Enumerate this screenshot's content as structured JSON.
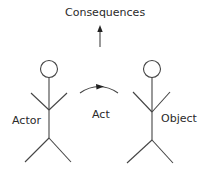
{
  "diagram": {
    "title_label": "Consequences",
    "actor_label": "Actor",
    "act_label": "Act",
    "object_label": "Object",
    "stroke_color": "#444444",
    "background": "#ffffff"
  }
}
